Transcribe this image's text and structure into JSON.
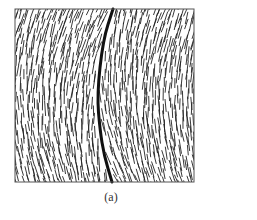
{
  "figure": {
    "panel_label": "(a)",
    "frame": {
      "x": 15,
      "y": 9,
      "width": 179,
      "height": 173,
      "stroke": "#555555"
    },
    "wall_curve": {
      "points": [
        [
          113,
          9
        ],
        [
          103,
          40
        ],
        [
          97,
          95
        ],
        [
          100,
          130
        ],
        [
          104,
          155
        ],
        [
          112,
          182
        ]
      ],
      "stroke": "#111111",
      "width": 3
    },
    "hatching": {
      "stroke": "#222222",
      "segment_length": 13,
      "spacing_x": 5.5,
      "spacing_y": 7,
      "top_angle_deg": 20,
      "bottom_angle_deg": -18
    }
  }
}
